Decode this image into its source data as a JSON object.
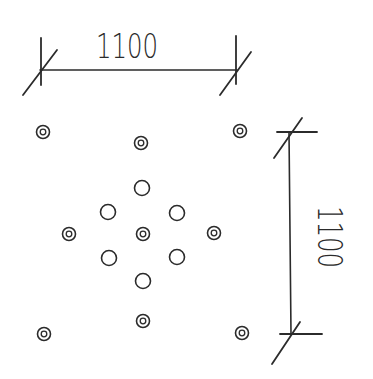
{
  "diagram": {
    "ink_color": "#2b2b2b",
    "background": "#ffffff",
    "dimensions": {
      "horizontal": {
        "label": "1100",
        "x1": 40,
        "x2": 237,
        "y": 70
      },
      "vertical": {
        "label": "1100",
        "x": 289,
        "y1": 132,
        "y2": 334
      }
    },
    "points": [
      {
        "x": 43,
        "y": 132,
        "type": "double"
      },
      {
        "x": 141,
        "y": 143,
        "type": "double"
      },
      {
        "x": 240,
        "y": 131,
        "type": "double"
      },
      {
        "x": 142,
        "y": 188,
        "type": "single"
      },
      {
        "x": 108,
        "y": 212,
        "type": "single"
      },
      {
        "x": 177,
        "y": 213,
        "type": "single"
      },
      {
        "x": 69,
        "y": 234,
        "type": "double"
      },
      {
        "x": 143,
        "y": 234,
        "type": "double"
      },
      {
        "x": 214,
        "y": 233,
        "type": "double"
      },
      {
        "x": 109,
        "y": 258,
        "type": "single"
      },
      {
        "x": 177,
        "y": 257,
        "type": "single"
      },
      {
        "x": 143,
        "y": 281,
        "type": "single"
      },
      {
        "x": 143,
        "y": 321,
        "type": "double"
      },
      {
        "x": 44,
        "y": 334,
        "type": "double"
      },
      {
        "x": 242,
        "y": 333,
        "type": "double"
      }
    ]
  }
}
